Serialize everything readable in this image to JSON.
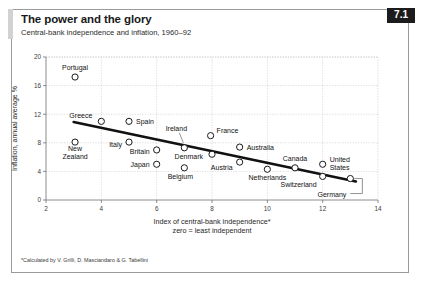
{
  "figure": {
    "number_badge": "7.1",
    "title": "The power and the glory",
    "subtitle": "Central-bank independence and inflation, 1960–92",
    "footnote": "*Calculated by V. Grilli, D. Masciandaro & G. Tabellini",
    "colors": {
      "badge_background": "#1c1c1c",
      "badge_text": "#ffffff",
      "accent_bar": "#d2d2d2",
      "frame_border": "#9a9a9a",
      "marker_fill": "#ffffff",
      "marker_stroke": "#1a1a1a",
      "trendline": "#111111",
      "grid": "#bdbdbd"
    }
  },
  "chart_data": {
    "type": "scatter",
    "title": "The power and the glory",
    "subtitle": "Central-bank independence and inflation, 1960–92",
    "xlabel": "Index of central-bank independence*",
    "xlabel_line2": "zero = least independent",
    "ylabel": "Inflation, annual average %",
    "xlim": [
      2,
      14
    ],
    "ylim": [
      0,
      20
    ],
    "xticks": [
      2,
      4,
      6,
      8,
      10,
      12,
      14
    ],
    "yticks": [
      0,
      4,
      8,
      12,
      16,
      20
    ],
    "grid": true,
    "legend": "none",
    "points": [
      {
        "name": "Portugal",
        "x": 3.05,
        "y": 17.2,
        "label_dx": 0,
        "label_dy": -7,
        "anchor": "middle",
        "leader": false
      },
      {
        "name": "Greece",
        "x": 4.0,
        "y": 11.0,
        "label_dx": -9,
        "label_dy": -3,
        "anchor": "end",
        "leader": false
      },
      {
        "name": "Spain",
        "x": 5.0,
        "y": 11.0,
        "label_dx": 7,
        "label_dy": 3,
        "anchor": "start",
        "leader": false
      },
      {
        "name": "New Zealand",
        "x": 3.05,
        "y": 8.1,
        "label_dx": 0,
        "label_dy": 9,
        "anchor": "middle",
        "leader": false
      },
      {
        "name": "Italy",
        "x": 5.0,
        "y": 8.1,
        "label_dx": -7,
        "label_dy": 5,
        "anchor": "end",
        "leader": false
      },
      {
        "name": "Britain",
        "x": 6.0,
        "y": 7.0,
        "label_dx": -7,
        "label_dy": 4,
        "anchor": "end",
        "leader": false
      },
      {
        "name": "Japan",
        "x": 6.0,
        "y": 5.0,
        "label_dx": -7,
        "label_dy": 3,
        "anchor": "end",
        "leader": false
      },
      {
        "name": "Ireland",
        "x": 7.0,
        "y": 7.3,
        "label_dx": -8,
        "label_dy": -17,
        "anchor": "middle",
        "leader": true
      },
      {
        "name": "France",
        "x": 7.95,
        "y": 9.0,
        "label_dx": 6,
        "label_dy": -3,
        "anchor": "start",
        "leader": false
      },
      {
        "name": "Denmark",
        "x": 8.0,
        "y": 6.4,
        "label_dx": -9,
        "label_dy": 5,
        "anchor": "end",
        "leader": false
      },
      {
        "name": "Belgium",
        "x": 7.0,
        "y": 4.5,
        "label_dx": -4,
        "label_dy": 11,
        "anchor": "middle",
        "leader": false
      },
      {
        "name": "Austria",
        "x": 9.0,
        "y": 5.3,
        "label_dx": -7,
        "label_dy": 8,
        "anchor": "end",
        "leader": false
      },
      {
        "name": "Australia",
        "x": 9.0,
        "y": 7.4,
        "label_dx": 7,
        "label_dy": 3,
        "anchor": "start",
        "leader": false
      },
      {
        "name": "Netherlands",
        "x": 10.0,
        "y": 4.3,
        "label_dx": 0,
        "label_dy": 11,
        "anchor": "middle",
        "leader": false
      },
      {
        "name": "Canada",
        "x": 11.0,
        "y": 4.5,
        "label_dx": 0,
        "label_dy": -7,
        "anchor": "middle",
        "leader": false
      },
      {
        "name": "Switzerland",
        "x": 12.0,
        "y": 3.3,
        "label_dx": -6,
        "label_dy": 11,
        "anchor": "end",
        "leader": false
      },
      {
        "name": "United States",
        "x": 12.0,
        "y": 5.0,
        "label_dx": 7,
        "label_dy": -2,
        "anchor": "start",
        "leader": false
      },
      {
        "name": "Germany",
        "x": 13.0,
        "y": 3.0,
        "label_dx": -4,
        "label_dy": 18,
        "anchor": "end",
        "leader": true
      }
    ],
    "trendline": {
      "x0": 3.0,
      "y0": 10.9,
      "x1": 13.2,
      "y1": 2.6
    }
  }
}
